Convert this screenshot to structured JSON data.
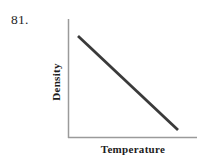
{
  "figure": {
    "number_label": "81."
  },
  "chart_data": {
    "type": "line",
    "title": "",
    "subtitle": "",
    "xlabel": "Temperature",
    "ylabel": "Density",
    "grid": false,
    "legend": null,
    "axis_style": "L-shaped open axes, no tick marks, no tick labels",
    "series": [
      {
        "name": "Density vs Temperature",
        "color": "#3a3a3a",
        "line_width_px": 2.8,
        "description": "Straight line with constant negative slope: density decreases linearly as temperature increases",
        "x": [
          0,
          1
        ],
        "values": [
          1,
          0
        ],
        "pixel_endpoints": {
          "start": [
            78,
            36
          ],
          "end": [
            178,
            130
          ]
        }
      }
    ],
    "xlim": [
      0,
      1
    ],
    "ylim": [
      0,
      1
    ],
    "xticks": [],
    "yticks": [],
    "xticklabels": [],
    "yticklabels": [],
    "annotations": []
  },
  "axes": {
    "color": "#9a9a9a",
    "line_width_px": 1.5,
    "origin_px": [
      68,
      138
    ],
    "y_axis_top_px": 19,
    "x_axis_right_px": 197
  },
  "colors": {
    "background": "#ffffff",
    "data_line": "#3a3a3a",
    "axis_line": "#9a9a9a",
    "label_text": "#1c1c1c",
    "number_text": "#262626"
  }
}
